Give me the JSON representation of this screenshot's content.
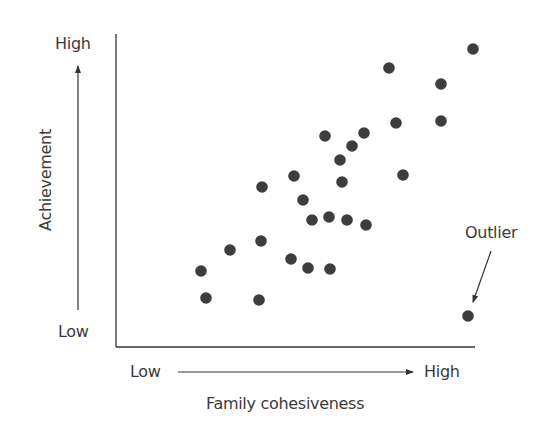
{
  "chart_data": {
    "type": "scatter",
    "title": "",
    "xlabel": "Family cohesiveness",
    "ylabel": "Achievement",
    "x_low_label": "Low",
    "x_high_label": "High",
    "y_low_label": "Low",
    "y_high_label": "High",
    "grid": false,
    "legend": null,
    "annotation": {
      "text": "Outlier",
      "points_to_index": 26
    },
    "axis_range_note": "Qualitative axes (Low to High); values normalized 0-100",
    "xlim": [
      0,
      100
    ],
    "ylim": [
      0,
      100
    ],
    "points": [
      {
        "x": 99,
        "y": 95
      },
      {
        "x": 76,
        "y": 89
      },
      {
        "x": 90,
        "y": 84
      },
      {
        "x": 78,
        "y": 71
      },
      {
        "x": 90,
        "y": 72
      },
      {
        "x": 58,
        "y": 67
      },
      {
        "x": 69,
        "y": 68
      },
      {
        "x": 66,
        "y": 64
      },
      {
        "x": 62,
        "y": 60
      },
      {
        "x": 50,
        "y": 54
      },
      {
        "x": 63,
        "y": 53
      },
      {
        "x": 80,
        "y": 55
      },
      {
        "x": 41,
        "y": 51
      },
      {
        "x": 52,
        "y": 47
      },
      {
        "x": 55,
        "y": 40
      },
      {
        "x": 59,
        "y": 41
      },
      {
        "x": 64,
        "y": 40
      },
      {
        "x": 70,
        "y": 39
      },
      {
        "x": 40,
        "y": 34
      },
      {
        "x": 32,
        "y": 31
      },
      {
        "x": 49,
        "y": 28
      },
      {
        "x": 54,
        "y": 25
      },
      {
        "x": 60,
        "y": 25
      },
      {
        "x": 24,
        "y": 24
      },
      {
        "x": 25,
        "y": 15
      },
      {
        "x": 40,
        "y": 15
      },
      {
        "x": 98,
        "y": 10
      }
    ],
    "pixel_points": [
      [
        473,
        49
      ],
      [
        389,
        68
      ],
      [
        441,
        84
      ],
      [
        396,
        123
      ],
      [
        441,
        121
      ],
      [
        325,
        136
      ],
      [
        364,
        133
      ],
      [
        352,
        146
      ],
      [
        340,
        160
      ],
      [
        294,
        176
      ],
      [
        342,
        182
      ],
      [
        403,
        175
      ],
      [
        262,
        187
      ],
      [
        303,
        200
      ],
      [
        312,
        220
      ],
      [
        329,
        217
      ],
      [
        347,
        220
      ],
      [
        366,
        225
      ],
      [
        261,
        241
      ],
      [
        230,
        250
      ],
      [
        291,
        259
      ],
      [
        308,
        268
      ],
      [
        330,
        269
      ],
      [
        201,
        271
      ],
      [
        206,
        298
      ],
      [
        259,
        300
      ],
      [
        468,
        316
      ]
    ],
    "colors": {
      "point": "#3d3d3d",
      "axis": "#333333",
      "text": "#3b3b3b"
    }
  }
}
